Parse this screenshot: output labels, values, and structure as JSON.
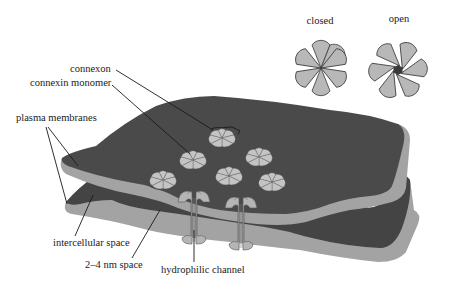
{
  "diagram": {
    "labels": {
      "closed": "closed",
      "open": "open",
      "connexon": "connexon",
      "connexin_monomer": "connexin monomer",
      "plasma_membranes": "plasma membranes",
      "intercellular_space": "intercellular space",
      "nm_space": "2–4 nm space",
      "hydrophilic_channel": "hydrophilic channel"
    },
    "insets": [
      {
        "state": "closed",
        "petals": 6,
        "pore": false
      },
      {
        "state": "open",
        "petals": 6,
        "pore": true
      }
    ],
    "connexon_count_surface": 7,
    "channel_cross_sections": 2,
    "colors": {
      "membrane_surface": "#4a4a4a",
      "membrane_edge": "#a3a3a3",
      "connexin": "#b8b8b8",
      "pore": "#3a3a3a",
      "text": "#1a1a1a"
    }
  }
}
